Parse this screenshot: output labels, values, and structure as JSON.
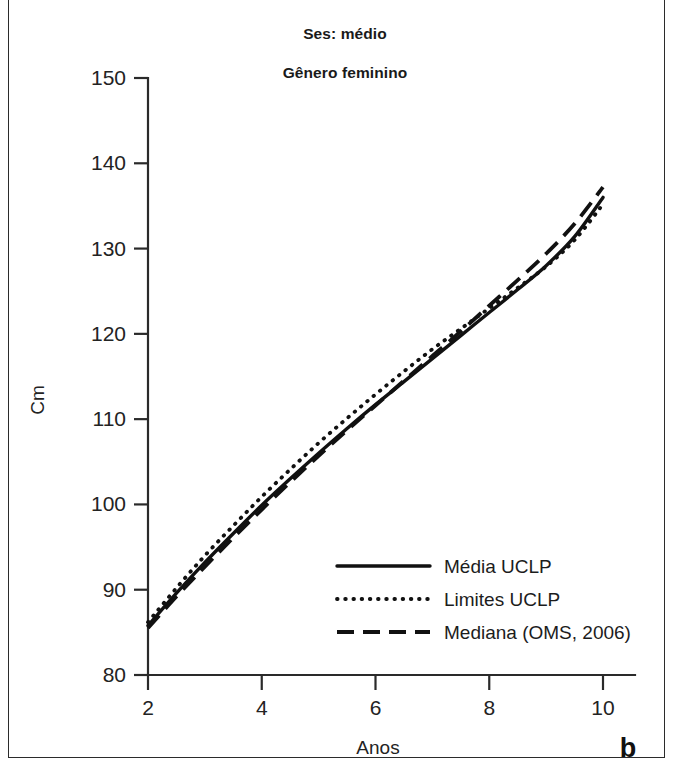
{
  "figure": {
    "panel_letter": "b",
    "title_line_1": "Ses: médio",
    "title_line_2": "Gênero feminino"
  },
  "chart_data": {
    "type": "line",
    "title": "Ses: médio\nGênero feminino",
    "xlabel": "Anos",
    "ylabel": "Cm",
    "xlim": [
      2,
      10
    ],
    "ylim": [
      80,
      150
    ],
    "xticks": [
      2,
      4,
      6,
      8,
      10
    ],
    "yticks": [
      80,
      90,
      100,
      110,
      120,
      130,
      140,
      150
    ],
    "xtick_labels": [
      "2",
      "4",
      "6",
      "8",
      "10"
    ],
    "ytick_labels": [
      "80",
      "90",
      "100",
      "110",
      "120",
      "130",
      "140",
      "150"
    ],
    "grid": false,
    "legend_position": "center-right-lower",
    "x": [
      2,
      2.5,
      3,
      3.5,
      4,
      4.5,
      5,
      5.5,
      6,
      6.5,
      7,
      7.5,
      8,
      8.5,
      9,
      9.5,
      10
    ],
    "series": [
      {
        "name": "Média UCLP",
        "style": "solid",
        "values": [
          85.8,
          89.6,
          93.2,
          96.6,
          99.9,
          103.0,
          106.0,
          108.9,
          111.7,
          114.4,
          117.1,
          119.8,
          122.5,
          125.2,
          128.0,
          131.4,
          136.0
        ]
      },
      {
        "name": "Limites UCLP",
        "style": "dotted",
        "values": [
          86.2,
          90.2,
          94.0,
          97.5,
          100.9,
          104.1,
          107.2,
          110.1,
          112.9,
          115.6,
          118.2,
          120.6,
          123.0,
          125.4,
          127.9,
          131.0,
          135.2
        ]
      },
      {
        "name": "Mediana (OMS, 2006)",
        "style": "dashed",
        "values": [
          85.5,
          89.2,
          92.7,
          96.1,
          99.4,
          102.6,
          105.7,
          108.7,
          111.6,
          114.5,
          117.4,
          120.3,
          123.3,
          126.3,
          129.4,
          132.9,
          137.2
        ]
      }
    ],
    "legend_entries": [
      {
        "label": "Média UCLP",
        "style": "solid"
      },
      {
        "label": "Limites UCLP",
        "style": "dotted"
      },
      {
        "label": "Mediana (OMS, 2006)",
        "style": "dashed"
      }
    ]
  },
  "colors": {
    "line": "#111111",
    "axis": "#2a2a2a",
    "text": "#232323",
    "background": "#ffffff",
    "frame": "#2b2b2b"
  }
}
